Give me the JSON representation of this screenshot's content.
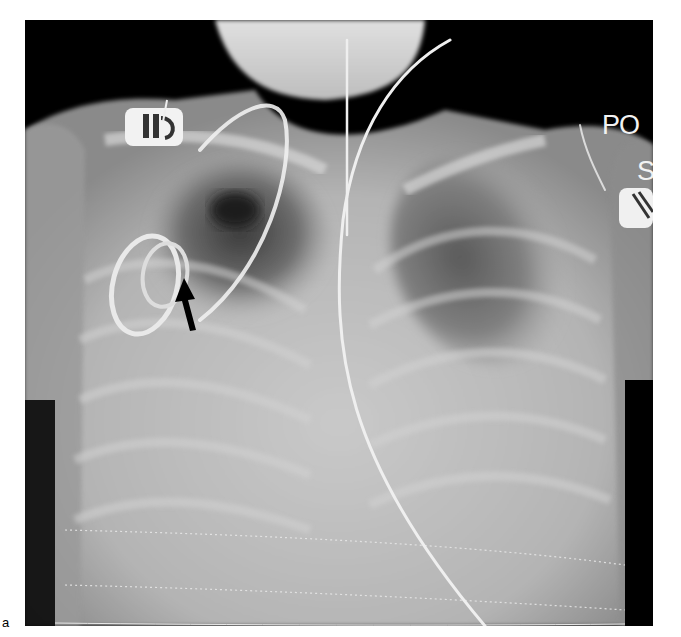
{
  "figure": {
    "panel_label": "a",
    "image_type": "chest-radiograph",
    "markers": {
      "position_label": "PO",
      "side_label": "S"
    },
    "annotation": {
      "type": "arrow",
      "direction": "up",
      "color": "#000000"
    },
    "colors": {
      "background": "#ffffff",
      "film_dark": "#000000",
      "tissue": "#b8b8b8",
      "bone": "#d6d6d6",
      "device": "#f2f2f2"
    }
  }
}
